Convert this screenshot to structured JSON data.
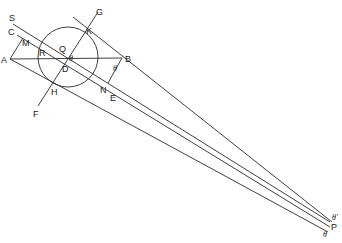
{
  "figure": {
    "type": "geometric-construction",
    "background": "#ffffff",
    "stroke": "#2a2a2a",
    "circle": {
      "cx": 68,
      "cy": 57,
      "r": 30
    },
    "points": {
      "A": "A",
      "B": "B",
      "C": "C",
      "D": "D",
      "E": "E",
      "F": "F",
      "G": "G",
      "H": "H",
      "K": "K",
      "M": "M",
      "N": "N",
      "Q": "Q",
      "R": "R",
      "S": "S",
      "P": "P"
    },
    "angles": {
      "theta_at_D": "θ",
      "theta_at_B": "θ",
      "theta_prime_at_P": "θ'",
      "theta_at_P": "θ"
    }
  }
}
